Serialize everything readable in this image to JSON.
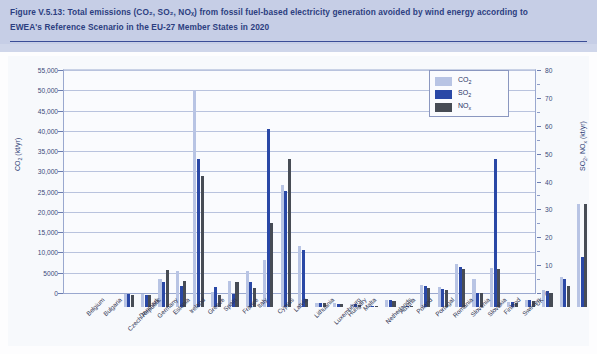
{
  "figure": {
    "caption_line1": "Figure V.5.13: Total emissions (CO₂, SO₂, NOₓ) from fossil fuel-based electricity generation avoided by wind energy according to",
    "caption_line2": "EWEA's Reference Scenario in the EU-27 Member States in 2020",
    "header_bg": "#c6cee6",
    "header_text_color": "#2c3e80"
  },
  "legend": {
    "position": "top-right",
    "entries": [
      {
        "label_html": "CO<sub>2</sub>",
        "name": "CO2",
        "color": "#b8c4e4"
      },
      {
        "label_html": "SO<sub>2</sub>",
        "name": "SO2",
        "color": "#2a48a6"
      },
      {
        "label_html": "NO<sub>x</sub>",
        "name": "NOx",
        "color": "#474c55"
      }
    ]
  },
  "axes": {
    "left_title_html": "CO<sub>2</sub> (kt/yr)",
    "right_title_html": "SO<sub>2</sub>, NO<sub>x</sub> (kt/yr)",
    "left_ticks": [
      "0",
      "5000",
      "10,000",
      "15,000",
      "20,000",
      "25,000",
      "30,000",
      "35,000",
      "40,000",
      "45,000",
      "50,000",
      "55,000"
    ],
    "right_ticks": [
      "0",
      "10",
      "20",
      "30",
      "40",
      "50",
      "60",
      "70",
      "80"
    ],
    "left_range": [
      0,
      55000
    ],
    "right_range": [
      0,
      80
    ],
    "grid": true
  },
  "chart_data": {
    "type": "bar",
    "title": "Total emissions (CO₂, SO₂, NOₓ) from fossil fuel-based electricity generation avoided by wind energy according to EWEA's Reference Scenario in the EU-27 Member States in 2020",
    "xlabel": "",
    "ylabel": "CO₂ (kt/yr)",
    "y2label": "SO₂, NOₓ (kt/yr)",
    "ylim": [
      0,
      55000
    ],
    "y2lim": [
      0,
      80
    ],
    "grid": true,
    "legend_position": "top-right",
    "categories": [
      "Belgium",
      "Bulgaria",
      "Czech Republic",
      "Denmark",
      "Germany",
      "Estonia",
      "Ireland",
      "Greece",
      "Spain",
      "France",
      "Italy",
      "Cyprus",
      "Latvia",
      "Lithuania",
      "Luxembourg",
      "Hungary",
      "Malta",
      "Netherlands",
      "Austria",
      "Poland",
      "Portugal",
      "Romania",
      "Slovenia",
      "Slovakia",
      "Finland",
      "Sweden",
      "UK"
    ],
    "series": [
      {
        "name": "CO2",
        "axis": "left",
        "unit": "kt/yr",
        "color": "#b8c4e4",
        "values": [
          3200,
          3100,
          7000,
          9000,
          53500,
          3600,
          6300,
          9000,
          11500,
          30000,
          15000,
          1000,
          900,
          800,
          300,
          1800,
          200,
          5500,
          5000,
          10500,
          7000,
          9500,
          1300,
          1800,
          4200,
          7500,
          25500
        ]
      },
      {
        "name": "SO2",
        "axis": "right",
        "unit": "kt/yr",
        "color": "#2a48a6",
        "values": [
          4.6,
          4.4,
          9.0,
          7.4,
          53.0,
          7.2,
          4.8,
          8.8,
          64.0,
          41.5,
          20.5,
          1.4,
          1.2,
          1.1,
          0.4,
          2.4,
          0.3,
          7.6,
          6.6,
          14.5,
          5.2,
          53.0,
          1.8,
          2.4,
          5.6,
          10.0,
          18.0
        ]
      },
      {
        "name": "NOx",
        "axis": "right",
        "unit": "kt/yr",
        "color": "#474c55",
        "values": [
          4.4,
          4.2,
          13.2,
          9.2,
          47.0,
          4.4,
          9.0,
          6.8,
          30.0,
          53.0,
          3.0,
          1.3,
          1.0,
          0.9,
          0.3,
          2.2,
          0.2,
          7.0,
          6.0,
          13.5,
          5.0,
          13.5,
          1.5,
          2.2,
          5.0,
          7.4,
          37.0
        ]
      }
    ]
  }
}
